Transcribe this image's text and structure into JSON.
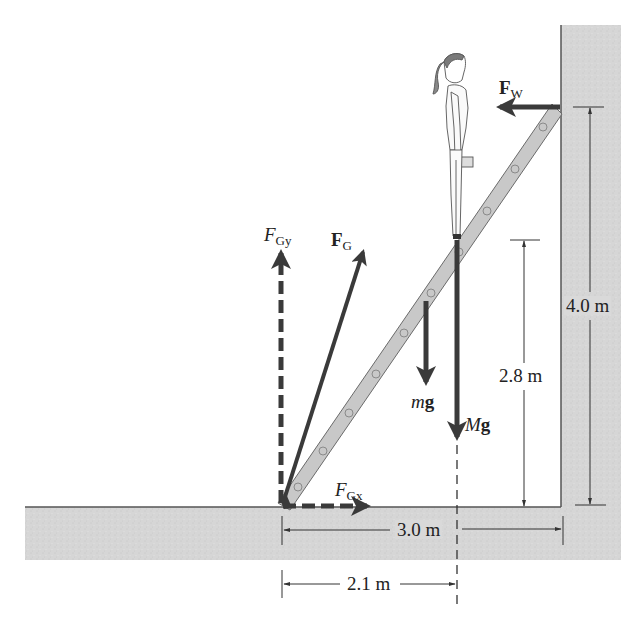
{
  "figure": {
    "colors": {
      "background": "#ffffff",
      "surface_fill": "#d6d6d6",
      "surface_edge": "#555555",
      "ladder_fill": "#c8c8c8",
      "ladder_edge": "#6a6a6a",
      "vector": "#3a3a3a",
      "dimension_line": "#333333",
      "text": "#222222"
    }
  },
  "labels": {
    "fw": {
      "main": "F",
      "sub": "W"
    },
    "fg": {
      "main": "F",
      "sub": "G"
    },
    "fgy": {
      "main": "F",
      "sub": "Gy"
    },
    "fgx": {
      "main": "F",
      "sub": "Gx"
    },
    "mg": {
      "italic": "m",
      "bold": "g"
    },
    "Mg": {
      "italic": "M",
      "bold": "g"
    }
  },
  "dimensions": {
    "height_wall_contact": "4.0 m",
    "height_person": "2.8 m",
    "base_distance": "3.0 m",
    "person_horizontal": "2.1 m"
  },
  "vectors": [
    {
      "name": "F_W",
      "direction": "left",
      "style": "solid"
    },
    {
      "name": "F_G",
      "direction": "up-right",
      "style": "solid"
    },
    {
      "name": "F_Gy",
      "direction": "up",
      "style": "dashed"
    },
    {
      "name": "F_Gx",
      "direction": "right",
      "style": "dashed"
    },
    {
      "name": "mg",
      "direction": "down",
      "style": "solid"
    },
    {
      "name": "Mg",
      "direction": "down",
      "style": "solid"
    }
  ]
}
